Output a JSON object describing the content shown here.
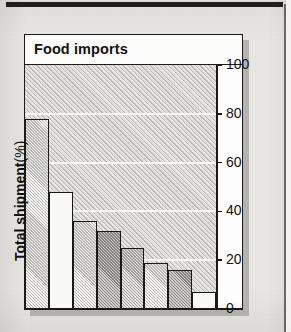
{
  "chart_data": {
    "type": "bar",
    "title": "Food imports",
    "xlabel": "",
    "ylabel": "Total shipment (%)",
    "ylabel_text": "Total shipment",
    "ylabel_unit": "(%)",
    "ylim": [
      0,
      100
    ],
    "yticks": [
      100,
      80,
      60,
      40,
      20,
      0
    ],
    "grid": true,
    "grid_axis": "y",
    "legend": "none",
    "categories": [
      "Austria",
      "West Germany",
      "Italy",
      "UK",
      "Netherlands",
      "Norway",
      "Denmark",
      "France"
    ],
    "values": [
      78,
      48,
      36,
      32,
      25,
      19,
      16,
      7
    ],
    "bar_fills": [
      "light",
      "white",
      "light",
      "dark",
      "mid",
      "light",
      "dark",
      "white"
    ],
    "label_placement": "rotated-vertical-above-bar"
  },
  "colors": {
    "paper": "#e8e7e4",
    "ink": "#1b1a19",
    "plot_background": "#d4d2ce",
    "gridline": "#fbfbfa",
    "title_strip": "#fdfdfc"
  }
}
